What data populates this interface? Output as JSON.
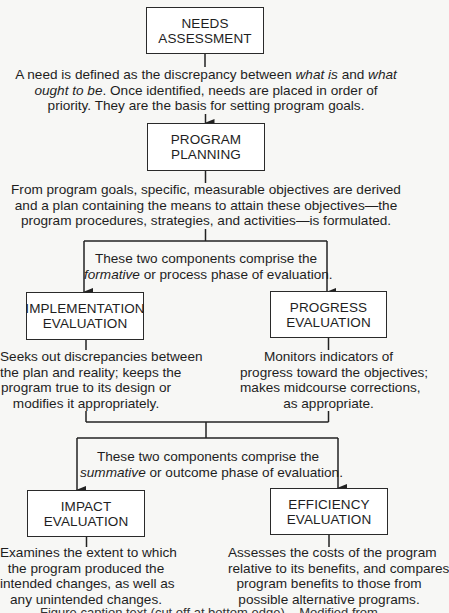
{
  "diagram": {
    "boxes": {
      "needs_assessment": {
        "line1": "NEEDS",
        "line2": "ASSESSMENT"
      },
      "program_planning": {
        "line1": "PROGRAM",
        "line2": "PLANNING"
      },
      "implementation_evaluation": {
        "line1": "IMPLEMENTATION",
        "line2": "EVALUATION"
      },
      "progress_evaluation": {
        "line1": "PROGRESS",
        "line2": "EVALUATION"
      },
      "impact_evaluation": {
        "line1": "IMPACT",
        "line2": "EVALUATION"
      },
      "efficiency_evaluation": {
        "line1": "EFFICIENCY",
        "line2": "EVALUATION"
      }
    },
    "descriptions": {
      "needs": {
        "l1_a": "A need is defined as the discrepancy between ",
        "l1_em1": "what is",
        "l1_b": " and ",
        "l1_em2": "what",
        "l2_em": "ought to be",
        "l2_b": ". Once identified, needs are placed in order of",
        "l3": "priority. They are the basis for setting program goals."
      },
      "planning": {
        "l1": "From program goals, specific, measurable objectives are derived",
        "l2": "and a plan containing the means to attain these objectives—the",
        "l3": "program procedures, strategies, and activities—is formulated."
      },
      "formative": {
        "l1": "These two components comprise the",
        "l2_em": "formative",
        "l2_b": " or process phase of evaluation."
      },
      "implementation": {
        "l1": "Seeks out discrepancies between",
        "l2": "the plan and reality; keeps the",
        "l3": "program true to its design or",
        "l4": "modifies it appropriately."
      },
      "progress": {
        "l1": "Monitors indicators of",
        "l2": "progress toward the objectives;",
        "l3": "makes midcourse corrections,",
        "l4": "as appropriate."
      },
      "summative": {
        "l1": "These two components comprise the",
        "l2_em": "summative",
        "l2_b": " or outcome phase of evaluation."
      },
      "impact": {
        "l1": "Examines the extent to which",
        "l2": "the program produced the",
        "l3": "intended changes, as well as",
        "l4": "any unintended changes."
      },
      "efficiency": {
        "l1": "Assesses the costs of the program",
        "l2": "relative to its benefits, and compares",
        "l3": "program benefits to those from",
        "l4": "possible alternative programs."
      }
    },
    "caption_cutoff": "Figure caption text (cut off at bottom edge)... Modified from"
  }
}
